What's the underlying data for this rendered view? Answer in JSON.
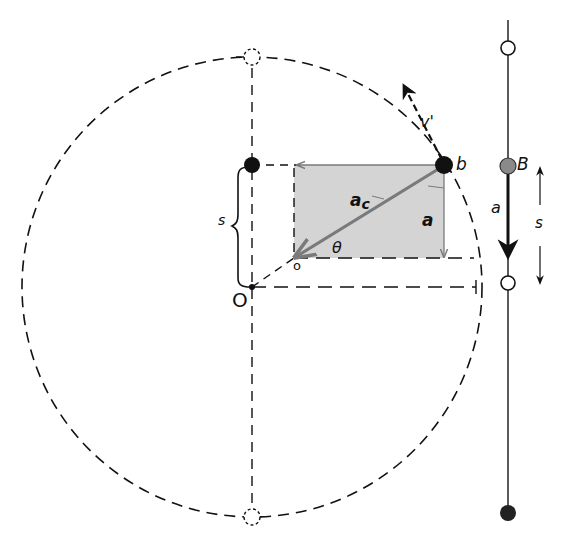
{
  "diagram": {
    "labels": {
      "center": "O",
      "rect_origin": "o",
      "point_circle": "b",
      "point_line": "B",
      "velocity": "v'",
      "centripetal_accel": "a",
      "centripetal_accel_sub": "c",
      "projected_accel": "a",
      "line_accel": "a",
      "angle": "θ",
      "displacement_left": "s",
      "displacement_right": "s"
    },
    "colors": {
      "line": "#111111",
      "shade": "#d4d4d4",
      "accent_arrow": "#7a7a7a",
      "ball_gray": "#8a8a8a"
    },
    "geometry": {
      "circle": {
        "cx": 252,
        "cy": 287,
        "r": 230
      },
      "point_b": {
        "x": 444,
        "y": 165
      },
      "rect": {
        "x1": 294,
        "y1": 165,
        "x2": 444,
        "y2": 258
      },
      "rod_x": 508
    }
  }
}
